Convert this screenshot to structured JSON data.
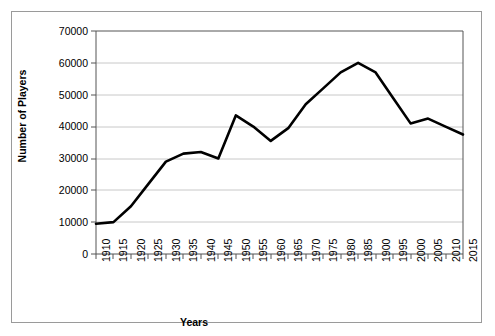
{
  "chart_data": {
    "type": "line",
    "title": "",
    "xlabel": "Years",
    "ylabel": "Number of Players",
    "ylim": [
      0,
      70000
    ],
    "ytick_values": [
      0,
      10000,
      20000,
      30000,
      40000,
      50000,
      60000,
      70000
    ],
    "ytick_labels": [
      "0",
      "10000",
      "20000",
      "30000",
      "40000",
      "50000",
      "60000",
      "70000"
    ],
    "grid": true,
    "legend": "none",
    "categories": [
      "1910",
      "1915",
      "1920",
      "1925",
      "1930",
      "1935",
      "1940",
      "1945",
      "1950",
      "1955",
      "1960",
      "1965",
      "1970",
      "1975",
      "1980",
      "1985",
      "1900",
      "1995",
      "2000",
      "2005",
      "2010",
      "2015"
    ],
    "x": [
      1910,
      1915,
      1920,
      1925,
      1930,
      1935,
      1940,
      1945,
      1950,
      1955,
      1960,
      1965,
      1970,
      1975,
      1980,
      1985,
      1990,
      1995,
      2000,
      2005,
      2010,
      2015
    ],
    "values": [
      9500,
      10000,
      15000,
      22000,
      29000,
      31500,
      32000,
      30000,
      43500,
      40000,
      35500,
      39500,
      47000,
      52000,
      57000,
      60000,
      57000,
      49000,
      41000,
      42500,
      40000,
      37500
    ],
    "series": [
      {
        "name": "Number of Players",
        "color": "#000000",
        "values": [
          9500,
          10000,
          15000,
          22000,
          29000,
          31500,
          32000,
          30000,
          43500,
          40000,
          35500,
          39500,
          47000,
          52000,
          57000,
          60000,
          57000,
          49000,
          41000,
          42500,
          40000,
          37500
        ]
      }
    ]
  },
  "colors": {
    "line": "#000000",
    "grid": "#c8c8c8",
    "axis": "#555555",
    "frame": "#9a9a9a",
    "background": "#ffffff"
  }
}
